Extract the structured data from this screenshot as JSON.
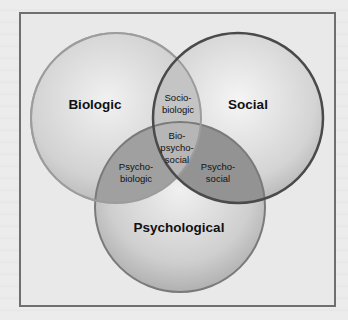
{
  "diagram": {
    "type": "venn",
    "circles": [
      {
        "id": "biologic",
        "label": "Biologic"
      },
      {
        "id": "social",
        "label": "Social"
      },
      {
        "id": "psychological",
        "label": "Psychological"
      }
    ],
    "intersections": {
      "sociobiologic": [
        "Socio-",
        "biologic"
      ],
      "biopsychosocial": [
        "Bio-",
        "psycho-",
        "social"
      ],
      "psychobiologic": [
        "Psycho-",
        "biologic"
      ],
      "psychosocial": [
        "Psycho-",
        "social"
      ]
    },
    "colors": {
      "frame_border": "#6f6f6f",
      "circle_light": "#d4d4d4",
      "social_outline": "#4a4a4a",
      "overlap_pair": "#9a9a9a",
      "overlap_center": "#b8b8b8"
    }
  }
}
